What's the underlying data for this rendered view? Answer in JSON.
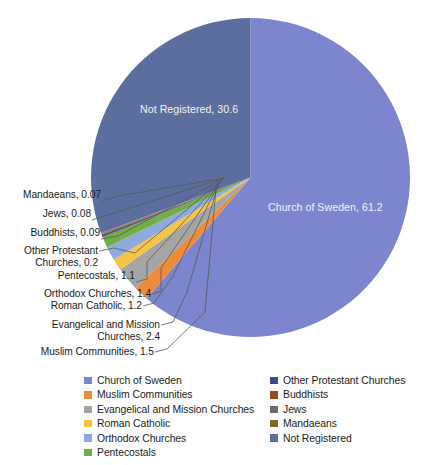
{
  "chart_data": {
    "type": "pie",
    "title": "",
    "unit": "percent",
    "categories": [
      "Church of Sweden",
      "Muslim Communities",
      "Evangelical and Mission Churches",
      "Roman Catholic",
      "Orthodox Churches",
      "Pentecostals",
      "Other Protestant Churches",
      "Buddhists",
      "Jews",
      "Mandaeans",
      "Not Registered"
    ],
    "values": [
      61.2,
      1.5,
      2.4,
      1.2,
      1.4,
      1.1,
      0.2,
      0.09,
      0.08,
      0.07,
      30.6
    ],
    "colors": [
      "#7C85CE",
      "#ED8B3C",
      "#A5A5A5",
      "#F6C445",
      "#8FAADC",
      "#72AD48",
      "#3C4D85",
      "#9C4A21",
      "#6C6C6C",
      "#7E6B2A",
      "#5C6E9E"
    ],
    "legend_position": "bottom",
    "grid": false,
    "start_angle_deg": 0,
    "direction": "clockwise"
  },
  "slice_labels": [
    {
      "text": "Church of Sweden, 61.2",
      "name": "church-of-sweden"
    },
    {
      "text": "Not Registered, 30.6",
      "name": "not-registered"
    }
  ],
  "callouts": [
    {
      "text": "Mandaeans, 0.07",
      "name": "mandaeans"
    },
    {
      "text": "Jews, 0.08",
      "name": "jews"
    },
    {
      "text": "Buddhists, 0.09",
      "name": "buddhists"
    },
    {
      "text": "Other Protestant\nChurches, 0.2",
      "name": "other-protestant-churches"
    },
    {
      "text": "Pentecostals, 1.1",
      "name": "pentecostals"
    },
    {
      "text": "Orthodox Churches, 1.4",
      "name": "orthodox-churches"
    },
    {
      "text": "Roman Catholic, 1.2",
      "name": "roman-catholic"
    },
    {
      "text": "Evangelical and Mission\nChurches, 2.4",
      "name": "evangelical-and-mission-churches"
    },
    {
      "text": "Muslim Communities, 1.5",
      "name": "muslim-communities"
    }
  ],
  "legend": {
    "left_column": [
      {
        "label": "Church of Sweden",
        "color": "#7C85CE"
      },
      {
        "label": "Muslim Communities",
        "color": "#ED8B3C"
      },
      {
        "label": "Evangelical and Mission Churches",
        "color": "#A5A5A5"
      },
      {
        "label": "Roman Catholic",
        "color": "#F6C445"
      },
      {
        "label": "Orthodox Churches",
        "color": "#8FAADC"
      },
      {
        "label": "Pentecostals",
        "color": "#72AD48"
      }
    ],
    "right_column": [
      {
        "label": "Other Protestant Churches",
        "color": "#3C4D85"
      },
      {
        "label": "Buddhists",
        "color": "#9C4A21"
      },
      {
        "label": "Jews",
        "color": "#6C6C6C"
      },
      {
        "label": "Mandaeans",
        "color": "#7E6B2A"
      },
      {
        "label": "Not Registered",
        "color": "#5C6E9E"
      }
    ]
  }
}
